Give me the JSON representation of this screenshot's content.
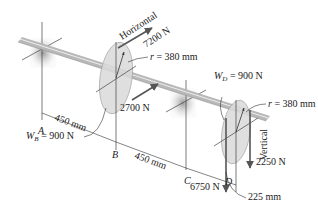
{
  "diagram": {
    "points": {
      "A": "A",
      "B": "B",
      "C": "C",
      "D": "D"
    },
    "labels": {
      "horizontal": "Horizontal",
      "vertical": "Vertical",
      "force_top": "7200 N",
      "force_B_horizontal": "2700 N",
      "force_D_vertical_right": "2250 N",
      "force_D_vertical_left": "6750 N",
      "radius_B": "r = 380 mm",
      "radius_D": "r = 380 mm",
      "weight_B_prefix": "W",
      "weight_B_sub": "B",
      "weight_B_value": " = 900 N",
      "weight_D_prefix": "W",
      "weight_D_sub": "D",
      "weight_D_value": " = 900 N",
      "dim_AB": "450 mm",
      "dim_BC": "450 mm",
      "dim_CD": "225 mm"
    },
    "colors": {
      "shaft": "#b8b8b8",
      "shaft_highlight": "#e6e6e6",
      "pulley_fill": "#d9d9d9",
      "bearing": "#bfbfbf",
      "force_arrow": "#555555",
      "text": "#222222"
    }
  }
}
